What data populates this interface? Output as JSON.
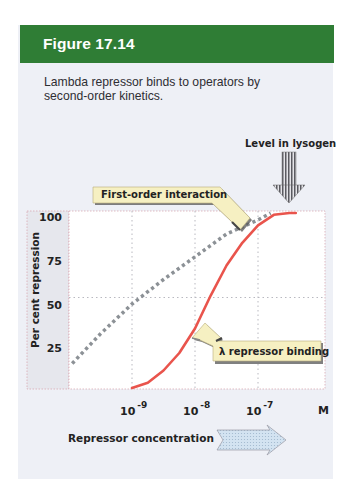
{
  "figure": {
    "title": "Figure 17.14",
    "caption": "Lambda repressor binds to operators by second-order kinetics."
  },
  "colors": {
    "header_green": "#2f7d35",
    "panel_bg": "#eef0f6",
    "repressor_curve": "#e9544c",
    "first_order_curve": "#8c9196",
    "callout_fill": "#f6f0c2"
  },
  "annotations": {
    "level_in_lysogen": "Level in lysogen",
    "first_order_callout": "First-order interaction",
    "repressor_callout": "λ repressor binding",
    "x_unit": "M",
    "x_direction_label": "Repressor concentration"
  },
  "chart_data": {
    "type": "line",
    "title": "",
    "xlabel": "Repressor concentration (M, log scale)",
    "ylabel": "Per cent repression",
    "x_scale": "log10",
    "xlim": [
      -10,
      -5.95
    ],
    "ylim": [
      0,
      100
    ],
    "x_ticks": [
      {
        "value": -9,
        "base": "10",
        "exp": "-9"
      },
      {
        "value": -8,
        "base": "10",
        "exp": "-8"
      },
      {
        "value": -7,
        "base": "10",
        "exp": "-7"
      }
    ],
    "y_ticks": [
      100,
      75,
      50,
      25
    ],
    "grid": {
      "vertical_at": [
        -9,
        -8,
        -7
      ],
      "horizontal_at": [
        50
      ],
      "style": "dotted"
    },
    "legend": "none (callout labels)",
    "series": [
      {
        "name": "First-order interaction",
        "style": "dotted",
        "x": [
          -9.95,
          -9.5,
          -9.0,
          -8.5,
          -8.0,
          -7.5,
          -7.0,
          -6.8
        ],
        "y": [
          14,
          31,
          48,
          62,
          75,
          88,
          96,
          100
        ]
      },
      {
        "name": "λ repressor binding",
        "style": "solid",
        "x": [
          -9.0,
          -8.75,
          -8.5,
          -8.25,
          -8.0,
          -7.75,
          -7.5,
          -7.25,
          -7.0,
          -6.75,
          -6.5,
          -6.4
        ],
        "y": [
          0,
          3,
          10,
          20,
          34,
          53,
          70,
          83,
          93,
          99,
          100,
          100
        ]
      }
    ],
    "annotations": [
      {
        "text": "Level in lysogen",
        "x": -6.5,
        "type": "down-arrow"
      }
    ]
  }
}
